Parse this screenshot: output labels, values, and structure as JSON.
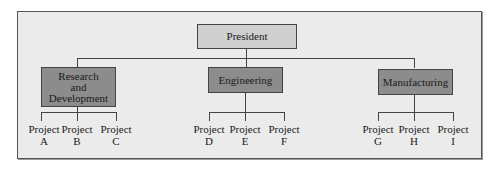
{
  "chart": {
    "root": {
      "label": "President"
    },
    "departments": [
      {
        "label": "Research and Development",
        "lines": [
          "Research",
          "and",
          "Development"
        ],
        "projects": [
          {
            "name": "Project",
            "id": "A"
          },
          {
            "name": "Project",
            "id": "B"
          },
          {
            "name": "Project",
            "id": "C"
          }
        ]
      },
      {
        "label": "Engineering",
        "lines": [
          "Engineering"
        ],
        "projects": [
          {
            "name": "Project",
            "id": "D"
          },
          {
            "name": "Project",
            "id": "E"
          },
          {
            "name": "Project",
            "id": "F"
          }
        ]
      },
      {
        "label": "Manufacturing",
        "lines": [
          "Manufacturing"
        ],
        "projects": [
          {
            "name": "Project",
            "id": "G"
          },
          {
            "name": "Project",
            "id": "H"
          },
          {
            "name": "Project",
            "id": "I"
          }
        ]
      }
    ]
  },
  "colors": {
    "frame_bg": "#ebebeb",
    "president_box": "#cfcfcf",
    "department_box": "#8c8c8c",
    "line": "#444444"
  }
}
